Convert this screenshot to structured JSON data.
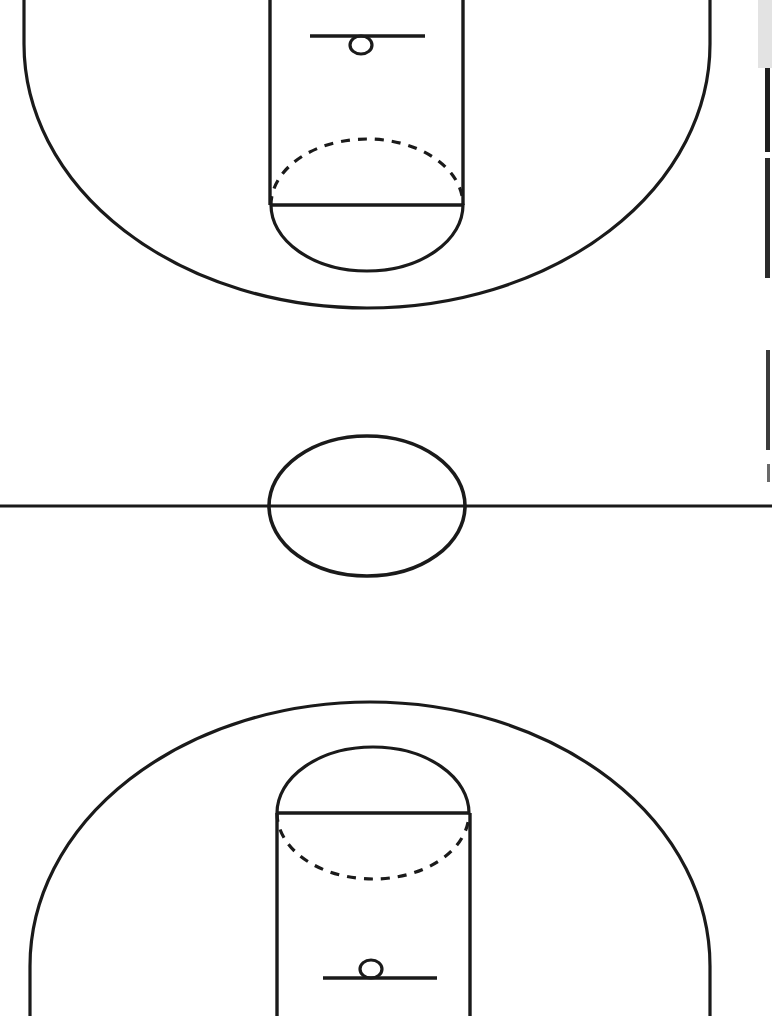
{
  "diagram": {
    "orientation": "vertical",
    "view": "full court, both halves shown, baselines cropped off top and bottom edges",
    "style": {
      "background_color": "#ffffff",
      "line_color": "#1a1a1a",
      "line_style": "solid black outline, scanned line-art",
      "fill": "none"
    },
    "canvas": {
      "width": 772,
      "height": 1016
    }
  },
  "court": {
    "center_x": 367,
    "halfcourt_line": {
      "label": "Half court line",
      "y": 506,
      "x_start": 0,
      "x_end": 772,
      "stroke_width": 3.2
    },
    "center_circle": {
      "label": "Center circle",
      "cx": 367,
      "cy": 506,
      "rx": 98,
      "ry": 70,
      "stroke_width": 3.6
    },
    "top_half": {
      "label": "Top half court",
      "three_point_arc": {
        "label": "Three point arc",
        "cx": 367,
        "cy": 44,
        "rx": 343,
        "ry": 264,
        "apex_y": 308,
        "left_x": 24,
        "right_x": 710,
        "stroke_width": 3.2
      },
      "key": {
        "label": "Key / paint lane",
        "left_x": 270,
        "right_x": 463,
        "top_y": 0,
        "free_throw_line_y": 205,
        "stroke_width": 3.4
      },
      "free_throw_line": {
        "label": "Free throw line",
        "y": 205,
        "x_start": 270,
        "x_end": 463,
        "stroke_width": 3.4
      },
      "free_throw_circle": {
        "label": "Free throw circle",
        "cx": 367,
        "cy": 205,
        "rx": 96,
        "ry": 66,
        "upper_half_style": "dashed",
        "lower_half_style": "solid",
        "dash_pattern": "9 8",
        "stroke_width": 3.2
      },
      "backboard": {
        "label": "Backboard",
        "y": 36,
        "x_start": 310,
        "x_end": 425,
        "stroke_width": 3.6
      },
      "hoop": {
        "label": "Hoop / rim",
        "cx": 361,
        "cy": 45,
        "rx": 11,
        "ry": 9,
        "position_relative_to_backboard": "below",
        "stroke_width": 3.2
      }
    },
    "bottom_half": {
      "label": "Bottom half court",
      "three_point_arc": {
        "label": "Three point arc",
        "cx": 370,
        "cy": 966,
        "rx": 340,
        "ry": 264,
        "apex_y": 702,
        "left_x": 30,
        "right_x": 710,
        "stroke_width": 3.2
      },
      "key": {
        "label": "Key / paint lane",
        "left_x": 277,
        "right_x": 470,
        "bottom_y": 1016,
        "free_throw_line_y": 813,
        "stroke_width": 3.4
      },
      "free_throw_line": {
        "label": "Free throw line",
        "y": 813,
        "x_start": 277,
        "x_end": 470,
        "stroke_width": 3.4
      },
      "free_throw_circle": {
        "label": "Free throw circle",
        "cx": 373,
        "cy": 813,
        "rx": 96,
        "ry": 66,
        "upper_half_style": "solid",
        "lower_half_style": "dashed",
        "dash_pattern": "9 8",
        "stroke_width": 3.2
      },
      "backboard": {
        "label": "Backboard",
        "y": 978,
        "x_start": 323,
        "x_end": 437,
        "stroke_width": 3.6
      },
      "hoop": {
        "label": "Hoop / rim",
        "cx": 371,
        "cy": 969,
        "rx": 11,
        "ry": 9,
        "position_relative_to_backboard": "above",
        "stroke_width": 3.2
      }
    }
  },
  "scan_artifacts": {
    "label": "Scanner edge artifacts on right margin",
    "items": [
      {
        "name": "gray-block-top-right",
        "x": 758,
        "y": 0,
        "width": 14,
        "height": 68,
        "color": "#e3e3e3"
      },
      {
        "name": "dark-edge-line-upper",
        "x": 765,
        "y": 68,
        "width": 5,
        "height": 84,
        "color": "#1f1f1f"
      },
      {
        "name": "dark-edge-line-mid",
        "x": 765,
        "y": 158,
        "width": 5,
        "height": 120,
        "color": "#2b2b2b"
      },
      {
        "name": "dark-edge-line-lower",
        "x": 766,
        "y": 350,
        "width": 4,
        "height": 100,
        "color": "#3c3c3c"
      },
      {
        "name": "soft-edge-mark",
        "x": 767,
        "y": 464,
        "width": 3,
        "height": 18,
        "color": "#6a6a6a"
      }
    ]
  }
}
